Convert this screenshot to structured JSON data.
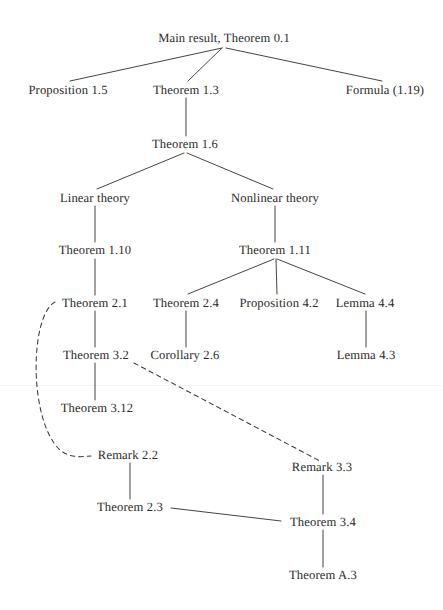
{
  "diagram": {
    "background_color": "#ffffff",
    "line_color": "#3a3a3a",
    "text_color": "#2b2b2b",
    "ghost_header_text": "",
    "nodes": [
      {
        "id": "main",
        "label": "Main result, Theorem 0.1",
        "x": 224,
        "y": 38
      },
      {
        "id": "prop15",
        "label": "Proposition 1.5",
        "x": 68,
        "y": 90
      },
      {
        "id": "thm13",
        "label": "Theorem 1.3",
        "x": 186,
        "y": 90
      },
      {
        "id": "form119",
        "label": "Formula (1.19)",
        "x": 385,
        "y": 90
      },
      {
        "id": "thm16",
        "label": "Theorem 1.6",
        "x": 185,
        "y": 144
      },
      {
        "id": "linear",
        "label": "Linear theory",
        "x": 95,
        "y": 198
      },
      {
        "id": "nonlinear",
        "label": "Nonlinear theory",
        "x": 275,
        "y": 198
      },
      {
        "id": "thm110",
        "label": "Theorem 1.10",
        "x": 95,
        "y": 250
      },
      {
        "id": "thm111",
        "label": "Theorem 1.11",
        "x": 275,
        "y": 250
      },
      {
        "id": "thm21",
        "label": "Theorem 2.1",
        "x": 95,
        "y": 303
      },
      {
        "id": "thm24",
        "label": "Theorem 2.4",
        "x": 186,
        "y": 303
      },
      {
        "id": "prop42",
        "label": "Proposition 4.2",
        "x": 279,
        "y": 303
      },
      {
        "id": "lem44",
        "label": "Lemma 4.4",
        "x": 365,
        "y": 303
      },
      {
        "id": "thm32",
        "label": "Theorem 3.2",
        "x": 96,
        "y": 355
      },
      {
        "id": "cor26",
        "label": "Corollary 2.6",
        "x": 185,
        "y": 355
      },
      {
        "id": "lem43",
        "label": "Lemma 4.3",
        "x": 366,
        "y": 355
      },
      {
        "id": "thm312",
        "label": "Theorem 3.12",
        "x": 97,
        "y": 408
      },
      {
        "id": "rem22",
        "label": "Remark 2.2",
        "x": 128,
        "y": 455
      },
      {
        "id": "rem33",
        "label": "Remark 3.3",
        "x": 322,
        "y": 467
      },
      {
        "id": "thm23",
        "label": "Theorem 2.3",
        "x": 130,
        "y": 507
      },
      {
        "id": "thm34",
        "label": "Theorem 3.4",
        "x": 323,
        "y": 522
      },
      {
        "id": "thma3",
        "label": "Theorem A.3",
        "x": 323,
        "y": 575
      }
    ],
    "edges": [
      {
        "from": "main",
        "to": "prop15",
        "style": "solid",
        "path": "M 222 48 L 70 81"
      },
      {
        "from": "main",
        "to": "thm13",
        "style": "solid",
        "path": "M 222 48 L 188 81"
      },
      {
        "from": "main",
        "to": "form119",
        "style": "solid",
        "path": "M 226 48 L 382 81"
      },
      {
        "from": "thm13",
        "to": "thm16",
        "style": "solid",
        "path": "M 186 98 L 186 136"
      },
      {
        "from": "thm16",
        "to": "linear",
        "style": "solid",
        "path": "M 184 153 L 97 189"
      },
      {
        "from": "thm16",
        "to": "nonlinear",
        "style": "solid",
        "path": "M 187 153 L 273 189"
      },
      {
        "from": "linear",
        "to": "thm110",
        "style": "solid",
        "path": "M 95 206 L 95 242"
      },
      {
        "from": "nonlinear",
        "to": "thm111",
        "style": "solid",
        "path": "M 275 206 L 275 242"
      },
      {
        "from": "thm110",
        "to": "thm21",
        "style": "solid",
        "path": "M 95 259 L 95 295"
      },
      {
        "from": "thm111",
        "to": "thm24",
        "style": "solid",
        "path": "M 274 259 L 188 294"
      },
      {
        "from": "thm111",
        "to": "prop42",
        "style": "solid",
        "path": "M 276 259 L 277 294"
      },
      {
        "from": "thm111",
        "to": "lem44",
        "style": "solid",
        "path": "M 277 259 L 365 294"
      },
      {
        "from": "thm21",
        "to": "thm32",
        "style": "solid",
        "path": "M 95 311 L 95 347"
      },
      {
        "from": "thm24",
        "to": "cor26",
        "style": "solid",
        "path": "M 186 311 L 186 347"
      },
      {
        "from": "lem44",
        "to": "lem43",
        "style": "solid",
        "path": "M 366 311 L 366 347"
      },
      {
        "from": "thm32",
        "to": "thm312",
        "style": "solid",
        "path": "M 95 363 L 95 400"
      },
      {
        "from": "rem22",
        "to": "thm23",
        "style": "solid",
        "path": "M 130 463 L 130 499"
      },
      {
        "from": "rem33",
        "to": "thm34",
        "style": "solid",
        "path": "M 323 475 L 323 514"
      },
      {
        "from": "thm23",
        "to": "thm34",
        "style": "solid",
        "path": "M 171 508 L 281 521"
      },
      {
        "from": "thm34",
        "to": "thma3",
        "style": "solid",
        "path": "M 323 530 L 323 567"
      },
      {
        "from": "thm21",
        "to": "rem22",
        "style": "dashed",
        "path": "M 55 302 C 30 315, 28 420, 60 450 C 70 458, 80 457, 91 456"
      },
      {
        "from": "thm32",
        "to": "rem33",
        "style": "dashed",
        "path": "M 134 363 L 320 461"
      }
    ]
  }
}
